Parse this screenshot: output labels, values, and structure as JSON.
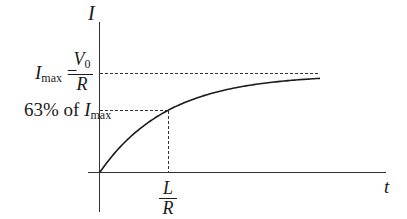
{
  "diagram": {
    "y_axis_label": "I",
    "x_axis_label": "t",
    "imax_label": {
      "lhs_symbol": "I",
      "lhs_sub": "max",
      "equals": "=",
      "numerator_symbol": "V",
      "numerator_sub": "0",
      "denominator": "R"
    },
    "percent_label": {
      "text": "63% of ",
      "symbol": "I",
      "sub": "max"
    },
    "time_constant_label": {
      "numerator": "L",
      "denominator": "R"
    }
  },
  "chart_data": {
    "type": "line",
    "title": "",
    "xlabel": "t",
    "ylabel": "I",
    "curve": "I(t) = Imax (1 - e^(-t/tau)), tau = L/R",
    "annotations": [
      {
        "type": "hline_dashed",
        "value": "Imax = V0/R"
      },
      {
        "type": "hline_dashed",
        "value": "0.63 Imax"
      },
      {
        "type": "vline_dashed",
        "value": "L/R"
      }
    ],
    "colors": {
      "line": "#1a1a1a",
      "background": "#ffffff"
    }
  }
}
